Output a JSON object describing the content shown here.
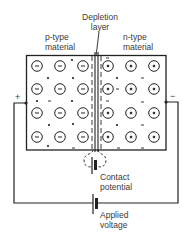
{
  "labels": {
    "depletion_line1": "Depletion",
    "depletion_line2": "layer",
    "p_type_line1": "p-type",
    "p_type_line2": "material",
    "n_type_line1": "n-type",
    "n_type_line2": "material",
    "contact_line1": "Contact",
    "contact_line2": "potential",
    "applied_line1": "Applied",
    "applied_line2": "voltage",
    "terminal_left": "+",
    "terminal_right": "−"
  },
  "diagram": {
    "p_region_ion_symbol": "−",
    "n_region_ion_symbol": "+",
    "ion_grid_rows": 4,
    "ion_grid_cols_per_side": 3,
    "stroke_color": "#222222"
  }
}
